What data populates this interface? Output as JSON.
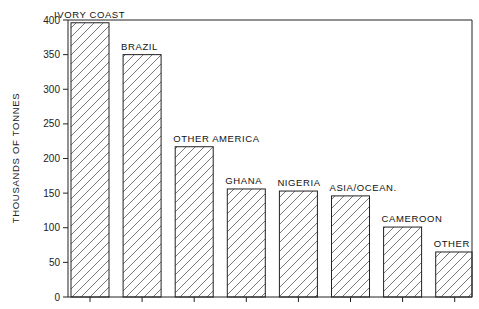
{
  "chart_data": {
    "type": "bar",
    "title": "",
    "xlabel": "",
    "ylabel": "THOUSANDS OF TONNES",
    "ylim": [
      0,
      400
    ],
    "yticks": [
      0,
      50,
      100,
      150,
      200,
      250,
      300,
      350,
      400
    ],
    "grid": false,
    "legend": null,
    "categories": [
      "IVORY COAST",
      "BRAZIL",
      "OTHER AMERICA",
      "GHANA",
      "NIGERIA",
      "ASIA/OCEAN.",
      "CAMEROON",
      "OTHER"
    ],
    "values": [
      396,
      350,
      217,
      156,
      153,
      146,
      101,
      65
    ],
    "bar_fill": "diagonal-hatch",
    "colors": {
      "stroke": "#222222",
      "hatch": "#444444",
      "background": "#ffffff"
    }
  }
}
